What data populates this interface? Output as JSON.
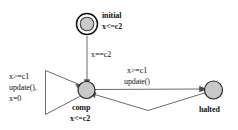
{
  "diagram": {
    "type": "state-machine",
    "colors": {
      "state_fill": "#c9c9c9",
      "state_stroke": "#2a2a2a",
      "edge_stroke": "#5a5a5a",
      "text": "#141414",
      "background": "#ffffff"
    },
    "states": [
      {
        "id": "initial",
        "name": "initial",
        "invariant": "x<=c2",
        "shape": "double-circle",
        "is_initial": true
      },
      {
        "id": "comp",
        "name": "comp",
        "invariant": "x<=c2",
        "shape": "circle",
        "is_initial": false
      },
      {
        "id": "halted",
        "name": "halted",
        "invariant": "",
        "shape": "circle",
        "is_initial": false
      }
    ],
    "transitions": [
      {
        "id": "initial-to-comp",
        "from": "initial",
        "to": "comp",
        "guard": "x==c2",
        "update": "",
        "label_lines": [
          "x==c2"
        ]
      },
      {
        "id": "comp-self-loop",
        "from": "comp",
        "to": "comp",
        "guard": "x>=c1",
        "update": "update(),",
        "assignment": "x=0",
        "label_lines": [
          "x>=c1",
          "update(),",
          "x=0"
        ]
      },
      {
        "id": "comp-to-halted",
        "from": "comp",
        "to": "halted",
        "guard": "x>=c1",
        "update": "update()",
        "label_lines": [
          "x>=c1",
          "update()"
        ]
      },
      {
        "id": "halted-to-comp",
        "from": "halted",
        "to": "comp",
        "guard": "",
        "update": "",
        "label_lines": []
      }
    ],
    "labels": {
      "initial_name": "initial",
      "initial_invariant": "x<=c2",
      "comp_name": "comp",
      "comp_invariant": "x<=c2",
      "halted_name": "halted",
      "edge_initial_comp": "x==c2",
      "selfloop_guard": "x>=c1",
      "selfloop_update": "update(),",
      "selfloop_assign": "x=0",
      "edge_comp_halted_guard": "x>=c1",
      "edge_comp_halted_update": "update()"
    }
  }
}
